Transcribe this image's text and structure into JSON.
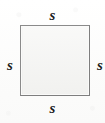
{
  "figure": {
    "type": "geometry-diagram",
    "width": 105,
    "height": 123,
    "background_color": "#ffffff"
  },
  "shape": {
    "name": "square",
    "fill_color": "#f4f4f2",
    "stroke_color": "#8a8a8a",
    "stroke_width": 1,
    "x": 20,
    "y": 25,
    "width": 70,
    "height": 71
  },
  "labels": {
    "top": "s",
    "right": "s",
    "bottom": "s",
    "left": "s",
    "style": "italic-serif",
    "color": "#1c1c1c"
  }
}
